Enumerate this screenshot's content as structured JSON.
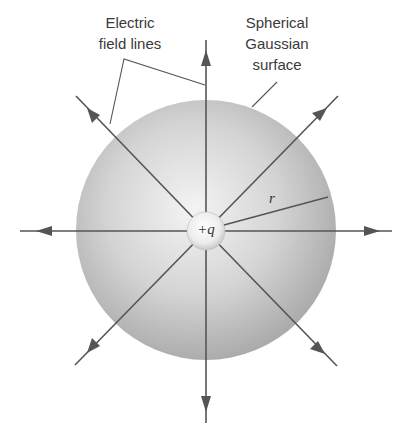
{
  "figure": {
    "labels": {
      "field_lines_line1": "Electric",
      "field_lines_line2": "field lines",
      "surface_line1": "Spherical",
      "surface_line2": "Gaussian",
      "surface_line3": "surface",
      "radius": "r",
      "charge": "+q"
    },
    "colors": {
      "line": "#555555",
      "sphere_light": "#f2f2f2",
      "sphere_mid": "#cfcfcf",
      "sphere_dark": "#a8a8a8",
      "background": "#ffffff"
    },
    "gaussian_sphere": {
      "cx": 206,
      "cy": 230,
      "r": 130
    },
    "point_charge": {
      "cx": 206,
      "cy": 231,
      "r": 19
    },
    "field_lines": [
      {
        "direction": "up",
        "x2": 206,
        "y2": 40
      },
      {
        "direction": "down",
        "x2": 206,
        "y2": 423
      },
      {
        "direction": "left",
        "x2": 20,
        "y2": 231
      },
      {
        "direction": "right",
        "x2": 392,
        "y2": 231
      },
      {
        "direction": "up-left",
        "x2": 76,
        "y2": 96
      },
      {
        "direction": "up-right",
        "x2": 338,
        "y2": 96
      },
      {
        "direction": "down-left",
        "x2": 75,
        "y2": 365
      },
      {
        "direction": "down-right",
        "x2": 337,
        "y2": 366
      }
    ]
  }
}
